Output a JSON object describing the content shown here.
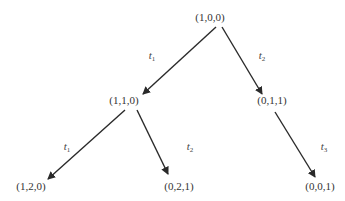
{
  "diagram": {
    "type": "reachability-tree",
    "nodes": [
      {
        "id": "n0",
        "label": "(1,0,0)",
        "x": 210,
        "y": 17
      },
      {
        "id": "n1",
        "label": "(1,1,0)",
        "x": 124,
        "y": 100
      },
      {
        "id": "n2",
        "label": "(0,1,1)",
        "x": 272,
        "y": 100
      },
      {
        "id": "n3",
        "label": "(1,2,0)",
        "x": 31,
        "y": 186
      },
      {
        "id": "n4",
        "label": "(0,2,1)",
        "x": 179,
        "y": 186
      },
      {
        "id": "n5",
        "label": "(0,0,1)",
        "x": 320,
        "y": 186
      }
    ],
    "edges": [
      {
        "from": "n0",
        "to": "n1",
        "label_base": "t",
        "label_sub": "1",
        "x1": 216,
        "y1": 27,
        "x2": 143,
        "y2": 94,
        "lx": 152,
        "ly": 57
      },
      {
        "from": "n0",
        "to": "n2",
        "label_base": "t",
        "label_sub": "2",
        "x1": 222,
        "y1": 27,
        "x2": 262,
        "y2": 94,
        "lx": 262,
        "ly": 57
      },
      {
        "from": "n1",
        "to": "n3",
        "label_base": "t",
        "label_sub": "1",
        "x1": 125,
        "y1": 110,
        "x2": 48,
        "y2": 179,
        "lx": 67,
        "ly": 148
      },
      {
        "from": "n1",
        "to": "n4",
        "label_base": "t",
        "label_sub": "2",
        "x1": 137,
        "y1": 110,
        "x2": 168,
        "y2": 174,
        "lx": 190,
        "ly": 148
      },
      {
        "from": "n2",
        "to": "n5",
        "label_base": "t",
        "label_sub": "3",
        "x1": 275,
        "y1": 112,
        "x2": 315,
        "y2": 177,
        "lx": 324,
        "ly": 148
      }
    ],
    "colors": {
      "line": "#2a2a2a",
      "text": "#333333"
    }
  }
}
